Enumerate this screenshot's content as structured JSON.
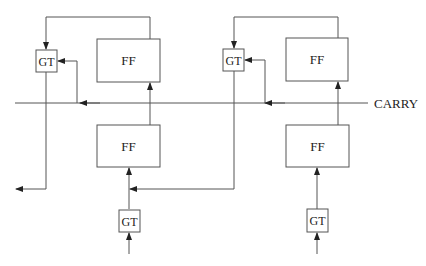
{
  "diagram": {
    "title": "",
    "carry_label": "CARRY",
    "stages": [
      {
        "gate_top": "GT",
        "ff_top": "FF",
        "ff_bottom": "FF",
        "gate_bottom": "GT"
      },
      {
        "gate_top": "GT",
        "ff_top": "FF",
        "ff_bottom": "FF",
        "gate_bottom": "GT"
      }
    ],
    "colors": {
      "line": "#555555",
      "text": "#222222",
      "background": "#ffffff"
    }
  }
}
